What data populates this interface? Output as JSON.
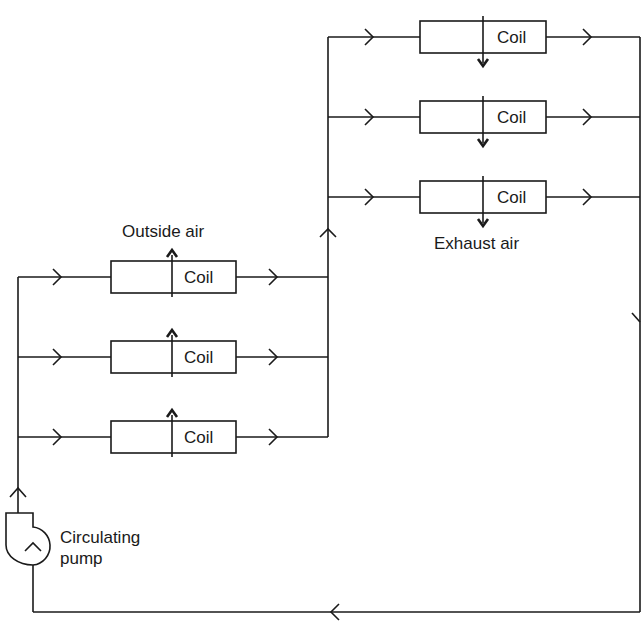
{
  "diagram": {
    "type": "run-around heat recovery coil loop",
    "line_color": "#1a1a1a",
    "background": "#ffffff",
    "labels": {
      "outside_air": "Outside air",
      "exhaust_air": "Exhaust air",
      "pump_line1": "Circulating",
      "pump_line2": "pump"
    },
    "supply_coils": [
      {
        "label": "Coil",
        "airflow": "up"
      },
      {
        "label": "Coil",
        "airflow": "up"
      },
      {
        "label": "Coil",
        "airflow": "up"
      }
    ],
    "exhaust_coils": [
      {
        "label": "Coil",
        "airflow": "down"
      },
      {
        "label": "Coil",
        "airflow": "down"
      },
      {
        "label": "Coil",
        "airflow": "down"
      }
    ],
    "components": {
      "pump": "circulating-pump",
      "flow_direction": "clockwise loop"
    }
  }
}
